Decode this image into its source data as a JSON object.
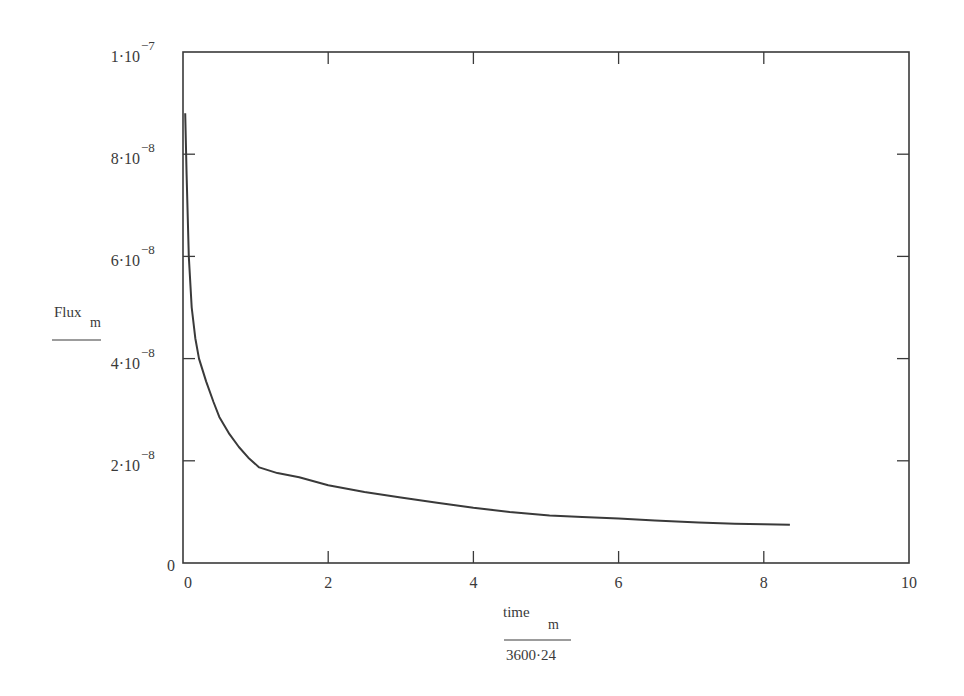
{
  "chart_data": {
    "type": "line",
    "title": "",
    "xlabel": {
      "numerator": "time",
      "numerator_subscript": "m",
      "denominator": "3600·24"
    },
    "ylabel": {
      "text": "Flux",
      "subscript": "m",
      "has_fraction_bar": true
    },
    "xlim": [
      0,
      10
    ],
    "ylim": [
      0,
      1e-07
    ],
    "grid": false,
    "legend": null,
    "x_ticks": [
      {
        "value": 0,
        "label": "0"
      },
      {
        "value": 2,
        "label": "2"
      },
      {
        "value": 4,
        "label": "4"
      },
      {
        "value": 6,
        "label": "6"
      },
      {
        "value": 8,
        "label": "8"
      },
      {
        "value": 10,
        "label": "10"
      }
    ],
    "y_ticks": [
      {
        "value": 0,
        "mantissa": "0",
        "exponent": ""
      },
      {
        "value": 2e-08,
        "mantissa": "2·10",
        "exponent": "−8"
      },
      {
        "value": 4e-08,
        "mantissa": "4·10",
        "exponent": "−8"
      },
      {
        "value": 6e-08,
        "mantissa": "6·10",
        "exponent": "−8"
      },
      {
        "value": 8e-08,
        "mantissa": "8·10",
        "exponent": "−8"
      },
      {
        "value": 1e-07,
        "mantissa": "1·10",
        "exponent": "−7"
      }
    ],
    "series": [
      {
        "name": "Flux_m",
        "color": "#3a3a3a",
        "x": [
          0.03,
          0.05,
          0.08,
          0.12,
          0.17,
          0.22,
          0.32,
          0.42,
          0.5,
          0.64,
          0.77,
          0.9,
          1.05,
          1.3,
          1.6,
          2.0,
          2.5,
          3.0,
          3.5,
          4.0,
          4.5,
          5.05,
          5.5,
          6.0,
          6.5,
          7.1,
          7.6,
          8.0,
          8.36
        ],
        "values": [
          8.8e-08,
          7.6e-08,
          6e-08,
          5e-08,
          4.4e-08,
          4e-08,
          3.55e-08,
          3.15e-08,
          2.86e-08,
          2.52e-08,
          2.27e-08,
          2.06e-08,
          1.87e-08,
          1.76e-08,
          1.68e-08,
          1.52e-08,
          1.39e-08,
          1.28e-08,
          1.18e-08,
          1.08e-08,
          1e-08,
          9.3e-09,
          9e-09,
          8.7e-09,
          8.3e-09,
          7.9e-09,
          7.7e-09,
          7.6e-09,
          7.5e-09
        ]
      }
    ]
  },
  "colors": {
    "axis": "#3a3a3a",
    "background": "#ffffff"
  }
}
